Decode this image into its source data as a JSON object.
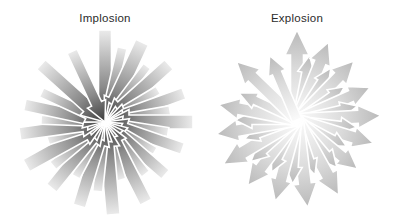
{
  "figure": {
    "title": "",
    "background_color": "#ffffff",
    "width": 405,
    "height": 221,
    "label_color": "#2b2b2b"
  },
  "panels": [
    {
      "id": "implosion",
      "label": "Implosion",
      "label_x": 105,
      "label_y": 13,
      "direction": "inward",
      "center_x": 105,
      "center_y": 122,
      "max_radius": 90,
      "color_outer": "#ebebeb",
      "color_inner": "#3a3a3a",
      "arrow_count": 30,
      "arrows": [
        {
          "angle": 270,
          "len": 92,
          "width": 13,
          "head": 25,
          "headw": 23
        },
        {
          "angle": 283,
          "len": 76,
          "width": 10,
          "head": 20,
          "headw": 19
        },
        {
          "angle": 295,
          "len": 88,
          "width": 14,
          "head": 24,
          "headw": 24
        },
        {
          "angle": 307,
          "len": 70,
          "width": 9,
          "head": 18,
          "headw": 17
        },
        {
          "angle": 318,
          "len": 86,
          "width": 13,
          "head": 23,
          "headw": 23
        },
        {
          "angle": 329,
          "len": 62,
          "width": 9,
          "head": 17,
          "headw": 16
        },
        {
          "angle": 340,
          "len": 84,
          "width": 12,
          "head": 22,
          "headw": 22
        },
        {
          "angle": 350,
          "len": 66,
          "width": 10,
          "head": 19,
          "headw": 18
        },
        {
          "angle": 0,
          "len": 88,
          "width": 14,
          "head": 24,
          "headw": 25
        },
        {
          "angle": 9,
          "len": 64,
          "width": 9,
          "head": 17,
          "headw": 17
        },
        {
          "angle": 19,
          "len": 82,
          "width": 12,
          "head": 22,
          "headw": 22
        },
        {
          "angle": 30,
          "len": 58,
          "width": 8,
          "head": 16,
          "headw": 15
        },
        {
          "angle": 41,
          "len": 80,
          "width": 12,
          "head": 21,
          "headw": 21
        },
        {
          "angle": 52,
          "len": 66,
          "width": 10,
          "head": 18,
          "headw": 18
        },
        {
          "angle": 63,
          "len": 90,
          "width": 13,
          "head": 24,
          "headw": 23
        },
        {
          "angle": 74,
          "len": 60,
          "width": 9,
          "head": 17,
          "headw": 16
        },
        {
          "angle": 85,
          "len": 93,
          "width": 14,
          "head": 25,
          "headw": 25
        },
        {
          "angle": 96,
          "len": 70,
          "width": 10,
          "head": 19,
          "headw": 18
        },
        {
          "angle": 107,
          "len": 88,
          "width": 13,
          "head": 23,
          "headw": 23
        },
        {
          "angle": 118,
          "len": 62,
          "width": 9,
          "head": 17,
          "headw": 16
        },
        {
          "angle": 129,
          "len": 85,
          "width": 13,
          "head": 22,
          "headw": 23
        },
        {
          "angle": 140,
          "len": 68,
          "width": 10,
          "head": 18,
          "headw": 18
        },
        {
          "angle": 151,
          "len": 90,
          "width": 14,
          "head": 24,
          "headw": 24
        },
        {
          "angle": 162,
          "len": 60,
          "width": 9,
          "head": 17,
          "headw": 16
        },
        {
          "angle": 172,
          "len": 86,
          "width": 13,
          "head": 23,
          "headw": 23
        },
        {
          "angle": 182,
          "len": 64,
          "width": 9,
          "head": 17,
          "headw": 17
        },
        {
          "angle": 192,
          "len": 82,
          "width": 12,
          "head": 21,
          "headw": 21
        },
        {
          "angle": 205,
          "len": 70,
          "width": 10,
          "head": 19,
          "headw": 18
        },
        {
          "angle": 222,
          "len": 86,
          "width": 13,
          "head": 23,
          "headw": 23
        },
        {
          "angle": 245,
          "len": 78,
          "width": 11,
          "head": 20,
          "headw": 20
        }
      ]
    },
    {
      "id": "explosion",
      "label": "Explosion",
      "label_x": 297,
      "label_y": 13,
      "direction": "outward",
      "center_x": 297,
      "center_y": 120,
      "max_radius": 88,
      "color_outer": "#b9b9b9",
      "color_inner": "#fbfbfb",
      "arrow_count": 30,
      "arrows": [
        {
          "angle": 270,
          "len": 90,
          "width": 13,
          "head": 25,
          "headw": 24
        },
        {
          "angle": 281,
          "len": 66,
          "width": 9,
          "head": 18,
          "headw": 17
        },
        {
          "angle": 292,
          "len": 84,
          "width": 12,
          "head": 22,
          "headw": 22
        },
        {
          "angle": 303,
          "len": 62,
          "width": 9,
          "head": 17,
          "headw": 16
        },
        {
          "angle": 314,
          "len": 82,
          "width": 12,
          "head": 22,
          "headw": 22
        },
        {
          "angle": 325,
          "len": 58,
          "width": 8,
          "head": 16,
          "headw": 15
        },
        {
          "angle": 336,
          "len": 80,
          "width": 12,
          "head": 21,
          "headw": 21
        },
        {
          "angle": 347,
          "len": 62,
          "width": 9,
          "head": 17,
          "headw": 16
        },
        {
          "angle": 357,
          "len": 84,
          "width": 13,
          "head": 23,
          "headw": 23
        },
        {
          "angle": 7,
          "len": 60,
          "width": 8,
          "head": 16,
          "headw": 16
        },
        {
          "angle": 17,
          "len": 80,
          "width": 12,
          "head": 21,
          "headw": 21
        },
        {
          "angle": 28,
          "len": 56,
          "width": 8,
          "head": 15,
          "headw": 15
        },
        {
          "angle": 39,
          "len": 78,
          "width": 11,
          "head": 20,
          "headw": 20
        },
        {
          "angle": 50,
          "len": 62,
          "width": 9,
          "head": 17,
          "headw": 17
        },
        {
          "angle": 61,
          "len": 86,
          "width": 13,
          "head": 23,
          "headw": 23
        },
        {
          "angle": 72,
          "len": 58,
          "width": 8,
          "head": 16,
          "headw": 15
        },
        {
          "angle": 83,
          "len": 88,
          "width": 13,
          "head": 24,
          "headw": 24
        },
        {
          "angle": 94,
          "len": 64,
          "width": 9,
          "head": 17,
          "headw": 17
        },
        {
          "angle": 105,
          "len": 84,
          "width": 12,
          "head": 22,
          "headw": 22
        },
        {
          "angle": 116,
          "len": 58,
          "width": 8,
          "head": 16,
          "headw": 16
        },
        {
          "angle": 127,
          "len": 82,
          "width": 12,
          "head": 22,
          "headw": 22
        },
        {
          "angle": 138,
          "len": 62,
          "width": 9,
          "head": 17,
          "headw": 17
        },
        {
          "angle": 149,
          "len": 86,
          "width": 13,
          "head": 23,
          "headw": 23
        },
        {
          "angle": 160,
          "len": 56,
          "width": 8,
          "head": 15,
          "headw": 15
        },
        {
          "angle": 170,
          "len": 82,
          "width": 12,
          "head": 22,
          "headw": 22
        },
        {
          "angle": 180,
          "len": 62,
          "width": 9,
          "head": 17,
          "headw": 17
        },
        {
          "angle": 191,
          "len": 80,
          "width": 12,
          "head": 21,
          "headw": 21
        },
        {
          "angle": 205,
          "len": 64,
          "width": 9,
          "head": 18,
          "headw": 17
        },
        {
          "angle": 224,
          "len": 84,
          "width": 12,
          "head": 22,
          "headw": 22
        },
        {
          "angle": 247,
          "len": 70,
          "width": 10,
          "head": 19,
          "headw": 19
        }
      ]
    }
  ]
}
